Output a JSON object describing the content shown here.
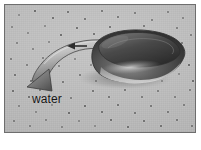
{
  "figure": {
    "kind": "photographic-diagram",
    "frame": {
      "border_color": "#6e6e6e",
      "background_color": "#ffffff",
      "plate_color": "#b9b9b9"
    }
  },
  "labels": {
    "water": "water"
  },
  "annotations": {
    "flow_arrow": {
      "name": "water-flow-arrow",
      "description": "broad curved ribbon arrow sweeping from behind the object down to the lower left",
      "head_direction": "down-left",
      "fill_light": "#cfcfcf",
      "fill_dark": "#6f6f6f",
      "outline": "#3f3f3f"
    },
    "small_arrow": {
      "name": "small-incoming-flow-arrow",
      "description": "short dark arrow above the ribbon pointing left",
      "head_direction": "left",
      "color": "#2e2e2e"
    }
  },
  "object": {
    "name": "rounded-object",
    "description": "dark glossy rounded stone-like object with a bright specular highlight along its lower edge",
    "body_dark": "#2b2b2b",
    "body_mid": "#5d5d5d",
    "highlight": "#d8d8d8",
    "outline": "#3a3a3a"
  },
  "bed": {
    "name": "sediment-bed",
    "base_color": "#b9b9b9",
    "speck_color": "#4a4a4a",
    "speck_count": 92,
    "specks": [
      {
        "x": 14,
        "y": 10,
        "r": 1.2
      },
      {
        "x": 30,
        "y": 6,
        "r": 0.9
      },
      {
        "x": 48,
        "y": 13,
        "r": 1.4
      },
      {
        "x": 63,
        "y": 7,
        "r": 1.0
      },
      {
        "x": 80,
        "y": 14,
        "r": 1.1
      },
      {
        "x": 97,
        "y": 6,
        "r": 1.3
      },
      {
        "x": 113,
        "y": 12,
        "r": 0.9
      },
      {
        "x": 130,
        "y": 8,
        "r": 1.2
      },
      {
        "x": 147,
        "y": 15,
        "r": 1.0
      },
      {
        "x": 163,
        "y": 7,
        "r": 1.3
      },
      {
        "x": 178,
        "y": 13,
        "r": 1.1
      },
      {
        "x": 7,
        "y": 22,
        "r": 1.0
      },
      {
        "x": 23,
        "y": 28,
        "r": 1.3
      },
      {
        "x": 40,
        "y": 21,
        "r": 0.9
      },
      {
        "x": 56,
        "y": 30,
        "r": 1.2
      },
      {
        "x": 72,
        "y": 23,
        "r": 1.0
      },
      {
        "x": 89,
        "y": 29,
        "r": 1.4
      },
      {
        "x": 105,
        "y": 22,
        "r": 0.9
      },
      {
        "x": 122,
        "y": 28,
        "r": 1.1
      },
      {
        "x": 139,
        "y": 21,
        "r": 1.2
      },
      {
        "x": 155,
        "y": 29,
        "r": 1.0
      },
      {
        "x": 172,
        "y": 23,
        "r": 1.3
      },
      {
        "x": 186,
        "y": 30,
        "r": 0.9
      },
      {
        "x": 12,
        "y": 38,
        "r": 1.2
      },
      {
        "x": 28,
        "y": 44,
        "r": 1.0
      },
      {
        "x": 44,
        "y": 37,
        "r": 1.3
      },
      {
        "x": 61,
        "y": 45,
        "r": 0.9
      },
      {
        "x": 78,
        "y": 38,
        "r": 1.1
      },
      {
        "x": 94,
        "y": 44,
        "r": 1.2
      },
      {
        "x": 111,
        "y": 37,
        "r": 0.9
      },
      {
        "x": 128,
        "y": 43,
        "r": 1.0
      },
      {
        "x": 144,
        "y": 36,
        "r": 1.2
      },
      {
        "x": 161,
        "y": 44,
        "r": 1.1
      },
      {
        "x": 177,
        "y": 38,
        "r": 1.0
      },
      {
        "x": 6,
        "y": 54,
        "r": 1.1
      },
      {
        "x": 22,
        "y": 60,
        "r": 1.3
      },
      {
        "x": 38,
        "y": 53,
        "r": 0.9
      },
      {
        "x": 54,
        "y": 61,
        "r": 1.2
      },
      {
        "x": 70,
        "y": 54,
        "r": 1.0
      },
      {
        "x": 86,
        "y": 60,
        "r": 1.1
      },
      {
        "x": 152,
        "y": 58,
        "r": 1.0
      },
      {
        "x": 169,
        "y": 52,
        "r": 1.3
      },
      {
        "x": 184,
        "y": 60,
        "r": 0.9
      },
      {
        "x": 10,
        "y": 70,
        "r": 1.2
      },
      {
        "x": 26,
        "y": 76,
        "r": 1.0
      },
      {
        "x": 42,
        "y": 69,
        "r": 1.1
      },
      {
        "x": 58,
        "y": 77,
        "r": 0.9
      },
      {
        "x": 75,
        "y": 70,
        "r": 1.3
      },
      {
        "x": 91,
        "y": 76,
        "r": 1.0
      },
      {
        "x": 107,
        "y": 70,
        "r": 1.2
      },
      {
        "x": 124,
        "y": 77,
        "r": 0.9
      },
      {
        "x": 140,
        "y": 70,
        "r": 1.1
      },
      {
        "x": 157,
        "y": 76,
        "r": 1.2
      },
      {
        "x": 174,
        "y": 69,
        "r": 1.0
      },
      {
        "x": 188,
        "y": 76,
        "r": 1.1
      },
      {
        "x": 8,
        "y": 86,
        "r": 1.0
      },
      {
        "x": 24,
        "y": 92,
        "r": 1.2
      },
      {
        "x": 88,
        "y": 86,
        "r": 1.1
      },
      {
        "x": 104,
        "y": 92,
        "r": 1.3
      },
      {
        "x": 120,
        "y": 85,
        "r": 0.9
      },
      {
        "x": 137,
        "y": 92,
        "r": 1.0
      },
      {
        "x": 153,
        "y": 86,
        "r": 1.2
      },
      {
        "x": 170,
        "y": 92,
        "r": 1.1
      },
      {
        "x": 185,
        "y": 85,
        "r": 0.9
      },
      {
        "x": 14,
        "y": 101,
        "r": 1.2
      },
      {
        "x": 31,
        "y": 107,
        "r": 1.0
      },
      {
        "x": 47,
        "y": 100,
        "r": 1.1
      },
      {
        "x": 64,
        "y": 108,
        "r": 1.3
      },
      {
        "x": 80,
        "y": 101,
        "r": 0.9
      },
      {
        "x": 97,
        "y": 107,
        "r": 1.2
      },
      {
        "x": 113,
        "y": 100,
        "r": 1.0
      },
      {
        "x": 130,
        "y": 108,
        "r": 1.1
      },
      {
        "x": 146,
        "y": 101,
        "r": 1.3
      },
      {
        "x": 163,
        "y": 107,
        "r": 0.9
      },
      {
        "x": 179,
        "y": 100,
        "r": 1.2
      },
      {
        "x": 9,
        "y": 116,
        "r": 1.0
      },
      {
        "x": 25,
        "y": 121,
        "r": 1.1
      },
      {
        "x": 41,
        "y": 115,
        "r": 1.2
      },
      {
        "x": 57,
        "y": 122,
        "r": 0.9
      },
      {
        "x": 74,
        "y": 116,
        "r": 1.0
      },
      {
        "x": 90,
        "y": 121,
        "r": 1.3
      },
      {
        "x": 106,
        "y": 115,
        "r": 1.1
      },
      {
        "x": 123,
        "y": 122,
        "r": 1.0
      },
      {
        "x": 139,
        "y": 116,
        "r": 1.2
      },
      {
        "x": 156,
        "y": 121,
        "r": 0.9
      },
      {
        "x": 172,
        "y": 115,
        "r": 1.1
      },
      {
        "x": 187,
        "y": 121,
        "r": 1.2
      },
      {
        "x": 35,
        "y": 85,
        "r": 0.9
      },
      {
        "x": 66,
        "y": 93,
        "r": 1.0
      },
      {
        "x": 118,
        "y": 60,
        "r": 1.0
      },
      {
        "x": 100,
        "y": 53,
        "r": 0.9
      },
      {
        "x": 133,
        "y": 64,
        "r": 1.1
      }
    ]
  }
}
